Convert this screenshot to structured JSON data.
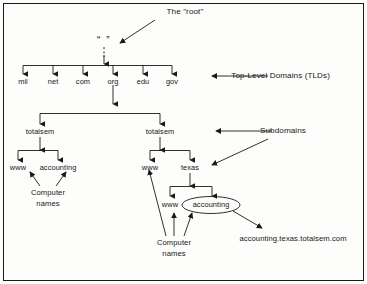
{
  "diagram": {
    "title_label": "The \"root\"",
    "root_node": "“ ”",
    "tld_annotation": "Top-Level Domains (TLDs)",
    "subdomain_annotation": "Subdomains",
    "fqdn_example": "accounting.texas.totalsem.com",
    "stroke_color": "#1a1a1a",
    "text_color": "#161616",
    "background_color": "#fdfdfc",
    "tlds": [
      {
        "label": "mil"
      },
      {
        "label": "net"
      },
      {
        "label": "com"
      },
      {
        "label": "org"
      },
      {
        "label": "edu"
      },
      {
        "label": "gov"
      }
    ],
    "subdomains": [
      {
        "label": "totalsem"
      },
      {
        "label": "totalsem"
      }
    ],
    "left_branch": {
      "hosts": [
        {
          "label": "www"
        },
        {
          "label": "accounting"
        }
      ],
      "caption_line1": "Computer",
      "caption_line2": "names"
    },
    "right_branch": {
      "hosts": [
        {
          "label": "www"
        },
        {
          "label": "texas"
        }
      ],
      "texas_children": [
        {
          "label": "www"
        },
        {
          "label": "accounting"
        }
      ],
      "caption_line1": "Computer",
      "caption_line2": "names"
    }
  }
}
